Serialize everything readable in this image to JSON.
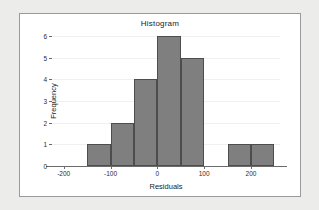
{
  "chart_data": {
    "type": "bar",
    "title": "Histogram",
    "xlabel": "Residuals",
    "ylabel": "Frequency",
    "grid": true,
    "legend": false,
    "xlim": [
      -225,
      262
    ],
    "ylim": [
      0,
      6
    ],
    "bin_width": 50,
    "x_ticks": [
      {
        "value": -200,
        "label": "-200"
      },
      {
        "value": -100,
        "label": "-100"
      },
      {
        "value": 0,
        "label": "0"
      },
      {
        "value": 100,
        "label": "100"
      },
      {
        "value": 200,
        "label": "200"
      }
    ],
    "y_ticks": [
      {
        "value": 0,
        "label": "0"
      },
      {
        "value": 1,
        "label": "1"
      },
      {
        "value": 2,
        "label": "2"
      },
      {
        "value": 3,
        "label": "3"
      },
      {
        "value": 4,
        "label": "4"
      },
      {
        "value": 5,
        "label": "5"
      },
      {
        "value": 6,
        "label": "6"
      }
    ],
    "bins": [
      {
        "start": -150,
        "end": -100,
        "value": 1
      },
      {
        "start": -100,
        "end": -50,
        "value": 2
      },
      {
        "start": -50,
        "end": 0,
        "value": 4
      },
      {
        "start": 0,
        "end": 50,
        "value": 6
      },
      {
        "start": 50,
        "end": 100,
        "value": 5
      },
      {
        "start": 100,
        "end": 150,
        "value": 0
      },
      {
        "start": 150,
        "end": 200,
        "value": 1
      },
      {
        "start": 200,
        "end": 250,
        "value": 1
      }
    ],
    "categories": [
      "-150 to -100",
      "-100 to -50",
      "-50 to 0",
      "0 to 50",
      "50 to 100",
      "100 to 150",
      "150 to 200",
      "200 to 250"
    ],
    "values": [
      1,
      2,
      4,
      6,
      5,
      0,
      1,
      1
    ],
    "colors": {
      "bar_fill": "#7f7f7f",
      "bar_border": "#4d4d4d",
      "panel_background": "#ffffff",
      "page_background": "#ececeb",
      "gridline": "#f0f0f0",
      "axis": "#6b6b6b"
    }
  }
}
